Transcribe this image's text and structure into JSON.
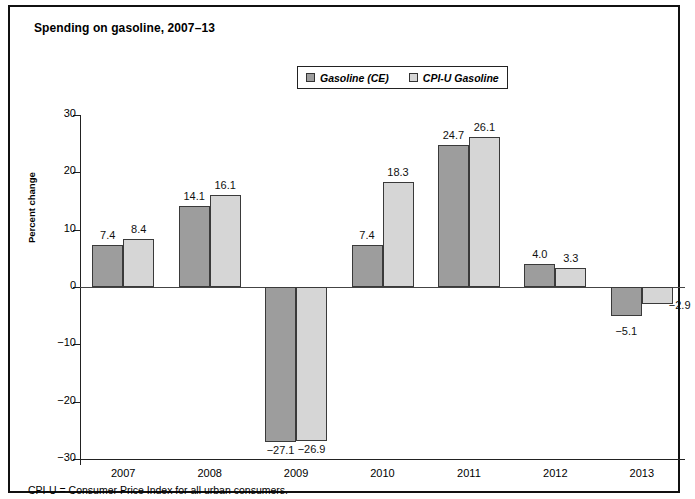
{
  "figure": {
    "title": "Spending on gasoline, 2007–13",
    "footnote": "CPI-U = Consumer Price Index for all urban consumers."
  },
  "chart_data": {
    "type": "bar",
    "title": "Spending on gasoline, 2007–13",
    "xlabel": "",
    "ylabel": "Percent change",
    "ylim": [
      -30,
      30
    ],
    "yticks": [
      30,
      20,
      10,
      0,
      -10,
      -20,
      -30
    ],
    "ytick_labels": [
      "30",
      "20",
      "10",
      "0",
      "−10",
      "−20",
      "−30"
    ],
    "grid": false,
    "legend_position": "top-center",
    "categories": [
      "2007",
      "2008",
      "2009",
      "2010",
      "2011",
      "2012",
      "2013"
    ],
    "series": [
      {
        "name": "Gasoline (CE)",
        "color": "#9d9d9d",
        "values": [
          7.4,
          14.1,
          -27.1,
          7.4,
          24.7,
          4.0,
          -5.1
        ],
        "labels": [
          "7.4",
          "14.1",
          "−27.1",
          "7.4",
          "24.7",
          "4.0",
          "−5.1"
        ]
      },
      {
        "name": "CPI-U Gasoline",
        "color": "#d6d6d6",
        "values": [
          8.4,
          16.1,
          -26.9,
          18.3,
          26.1,
          3.3,
          -2.9
        ],
        "labels": [
          "8.4",
          "16.1",
          "−26.9",
          "18.3",
          "26.1",
          "3.3",
          "−2.9"
        ]
      }
    ]
  }
}
